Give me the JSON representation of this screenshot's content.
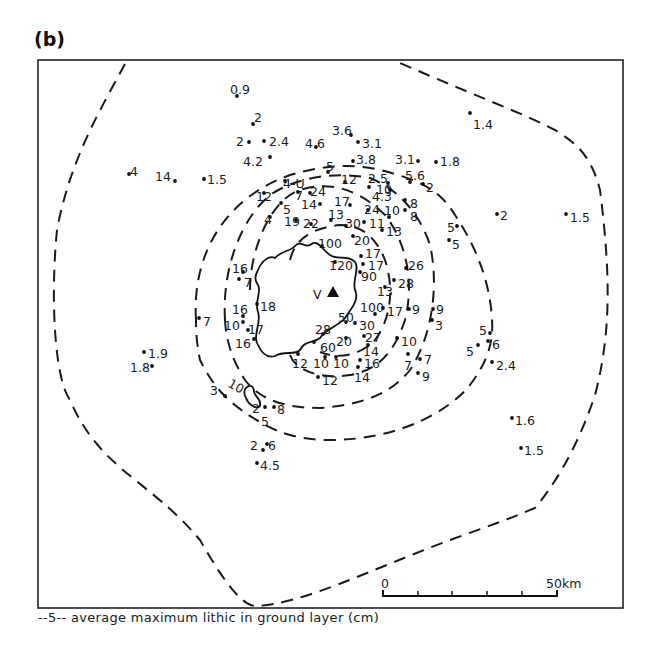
{
  "figure": {
    "panel_label": "(b)",
    "legend_text": "--5-- average maximum lithic in ground layer (cm)",
    "volcano_marker_label": "V",
    "scale_bar": {
      "start_label": "0",
      "end_label": "50km",
      "ticks": 6
    },
    "isopleth_labels": [
      "10",
      "5"
    ]
  },
  "chart_data": {
    "type": "map",
    "title": "(b)",
    "legend": "--5-- average maximum lithic in ground layer (cm)",
    "scale": "0-50 km",
    "isopleths_cm": [
      5,
      10
    ],
    "points": [
      {
        "v": "0.9",
        "x": 237,
        "y": 96,
        "lx": 230,
        "ly": 90
      },
      {
        "v": "2",
        "x": 253,
        "y": 124,
        "lx": 254,
        "ly": 118
      },
      {
        "v": "2",
        "x": 249,
        "y": 142,
        "lx": 236,
        "ly": 142
      },
      {
        "v": "2.4",
        "x": 264,
        "y": 141,
        "lx": 269,
        "ly": 142
      },
      {
        "v": "4.2",
        "x": 270,
        "y": 157,
        "lx": 243,
        "ly": 162
      },
      {
        "v": "4.6",
        "x": 316,
        "y": 147,
        "lx": 305,
        "ly": 144
      },
      {
        "v": "3.6",
        "x": 351,
        "y": 135,
        "lx": 332,
        "ly": 131
      },
      {
        "v": "3.1",
        "x": 358,
        "y": 142,
        "lx": 362,
        "ly": 144
      },
      {
        "v": "3.8",
        "x": 353,
        "y": 161,
        "lx": 356,
        "ly": 160
      },
      {
        "v": "3.1",
        "x": 418,
        "y": 161,
        "lx": 395,
        "ly": 160
      },
      {
        "v": "1.8",
        "x": 436,
        "y": 162,
        "lx": 440,
        "ly": 162
      },
      {
        "v": "1.4",
        "x": 470,
        "y": 113,
        "lx": 473,
        "ly": 125
      },
      {
        "v": "4",
        "x": 129,
        "y": 174,
        "lx": 130,
        "ly": 172
      },
      {
        "v": "14",
        "x": 175,
        "y": 181,
        "lx": 155,
        "ly": 177
      },
      {
        "v": "1.5",
        "x": 204,
        "y": 179,
        "lx": 207,
        "ly": 180
      },
      {
        "v": "5",
        "x": 328,
        "y": 172,
        "lx": 326,
        "ly": 167
      },
      {
        "v": "12",
        "x": 345,
        "y": 182,
        "lx": 341,
        "ly": 180
      },
      {
        "v": "2.5",
        "x": 388,
        "y": 183,
        "lx": 368,
        "ly": 179
      },
      {
        "v": "5.6",
        "x": 410,
        "y": 182,
        "lx": 405,
        "ly": 176
      },
      {
        "v": "2",
        "x": 423,
        "y": 184,
        "lx": 426,
        "ly": 188
      },
      {
        "v": "4.3",
        "x": 390,
        "y": 190,
        "lx": 372,
        "ly": 197
      },
      {
        "v": "10",
        "x": 369,
        "y": 187,
        "lx": 376,
        "ly": 190
      },
      {
        "v": "8",
        "x": 405,
        "y": 200,
        "lx": 410,
        "ly": 204
      },
      {
        "v": "8",
        "x": 405,
        "y": 210,
        "lx": 410,
        "ly": 217
      },
      {
        "v": "4-U",
        "x": 285,
        "y": 181,
        "lx": 283,
        "ly": 184
      },
      {
        "v": "12",
        "x": 264,
        "y": 193,
        "lx": 256,
        "ly": 197
      },
      {
        "v": "7",
        "x": 298,
        "y": 192,
        "lx": 295,
        "ly": 196
      },
      {
        "v": "24",
        "x": 310,
        "y": 193,
        "lx": 310,
        "ly": 192
      },
      {
        "v": "5",
        "x": 281,
        "y": 203,
        "lx": 283,
        "ly": 210
      },
      {
        "v": "14",
        "x": 320,
        "y": 204,
        "lx": 301,
        "ly": 205
      },
      {
        "v": "17",
        "x": 350,
        "y": 205,
        "lx": 334,
        "ly": 202
      },
      {
        "v": "24",
        "x": 368,
        "y": 210,
        "lx": 364,
        "ly": 210
      },
      {
        "v": "10",
        "x": 389,
        "y": 217,
        "lx": 384,
        "ly": 211
      },
      {
        "v": "4",
        "x": 270,
        "y": 217,
        "lx": 264,
        "ly": 220
      },
      {
        "v": "19",
        "x": 296,
        "y": 220,
        "lx": 284,
        "ly": 222
      },
      {
        "v": "22",
        "x": 311,
        "y": 224,
        "lx": 303,
        "ly": 224
      },
      {
        "v": "13",
        "x": 331,
        "y": 220,
        "lx": 328,
        "ly": 215
      },
      {
        "v": "30",
        "x": 346,
        "y": 226,
        "lx": 345,
        "ly": 224
      },
      {
        "v": "11",
        "x": 364,
        "y": 222,
        "lx": 369,
        "ly": 224
      },
      {
        "v": "13",
        "x": 382,
        "y": 230,
        "lx": 386,
        "ly": 232
      },
      {
        "v": "20",
        "x": 353,
        "y": 236,
        "lx": 354,
        "ly": 241
      },
      {
        "v": "100",
        "x": 322,
        "y": 246,
        "lx": 318,
        "ly": 244
      },
      {
        "v": "17",
        "x": 361,
        "y": 256,
        "lx": 365,
        "ly": 254
      },
      {
        "v": "120",
        "x": 335,
        "y": 262,
        "lx": 329,
        "ly": 266
      },
      {
        "v": "17",
        "x": 363,
        "y": 264,
        "lx": 368,
        "ly": 266
      },
      {
        "v": "90",
        "x": 360,
        "y": 272,
        "lx": 361,
        "ly": 277
      },
      {
        "v": "26",
        "x": 406,
        "y": 268,
        "lx": 408,
        "ly": 266
      },
      {
        "v": "28",
        "x": 394,
        "y": 280,
        "lx": 398,
        "ly": 284
      },
      {
        "v": "13",
        "x": 385,
        "y": 287,
        "lx": 377,
        "ly": 292
      },
      {
        "v": "16",
        "x": 243,
        "y": 272,
        "lx": 232,
        "ly": 269
      },
      {
        "v": "7",
        "x": 239,
        "y": 279,
        "lx": 244,
        "ly": 283
      },
      {
        "v": "18",
        "x": 257,
        "y": 304,
        "lx": 260,
        "ly": 307
      },
      {
        "v": "16",
        "x": 243,
        "y": 316,
        "lx": 232,
        "ly": 310
      },
      {
        "v": "10",
        "x": 243,
        "y": 322,
        "lx": 224,
        "ly": 326
      },
      {
        "v": "17",
        "x": 248,
        "y": 330,
        "lx": 248,
        "ly": 330
      },
      {
        "v": "16",
        "x": 254,
        "y": 339,
        "lx": 235,
        "ly": 344
      },
      {
        "v": "7",
        "x": 199,
        "y": 318,
        "lx": 203,
        "ly": 322
      },
      {
        "v": "100",
        "x": 375,
        "y": 314,
        "lx": 360,
        "ly": 308
      },
      {
        "v": "17",
        "x": 383,
        "y": 308,
        "lx": 387,
        "ly": 312
      },
      {
        "v": "9",
        "x": 409,
        "y": 309,
        "lx": 412,
        "ly": 310
      },
      {
        "v": "9",
        "x": 433,
        "y": 309,
        "lx": 436,
        "ly": 310
      },
      {
        "v": "3",
        "x": 432,
        "y": 320,
        "lx": 435,
        "ly": 326
      },
      {
        "v": "50",
        "x": 346,
        "y": 322,
        "lx": 338,
        "ly": 318
      },
      {
        "v": "30",
        "x": 355,
        "y": 323,
        "lx": 359,
        "ly": 326
      },
      {
        "v": "28",
        "x": 323,
        "y": 334,
        "lx": 315,
        "ly": 330
      },
      {
        "v": "20",
        "x": 346,
        "y": 338,
        "lx": 336,
        "ly": 342
      },
      {
        "v": "27",
        "x": 364,
        "y": 336,
        "lx": 365,
        "ly": 338
      },
      {
        "v": "10",
        "x": 397,
        "y": 338,
        "lx": 401,
        "ly": 342
      },
      {
        "v": "60",
        "x": 314,
        "y": 342,
        "lx": 320,
        "ly": 348
      },
      {
        "v": "14",
        "x": 368,
        "y": 345,
        "lx": 363,
        "ly": 352
      },
      {
        "v": "12",
        "x": 298,
        "y": 354,
        "lx": 292,
        "ly": 364
      },
      {
        "v": "10",
        "x": 325,
        "y": 357,
        "lx": 313,
        "ly": 364
      },
      {
        "v": "10",
        "x": 336,
        "y": 357,
        "lx": 333,
        "ly": 364
      },
      {
        "v": "16",
        "x": 360,
        "y": 360,
        "lx": 364,
        "ly": 364
      },
      {
        "v": "14",
        "x": 358,
        "y": 367,
        "lx": 354,
        "ly": 378
      },
      {
        "v": "12",
        "x": 318,
        "y": 377,
        "lx": 322,
        "ly": 381
      },
      {
        "v": "7",
        "x": 408,
        "y": 354,
        "lx": 404,
        "ly": 366
      },
      {
        "v": "7",
        "x": 420,
        "y": 359,
        "lx": 424,
        "ly": 360
      },
      {
        "v": "9",
        "x": 418,
        "y": 373,
        "lx": 422,
        "ly": 377
      },
      {
        "v": "5",
        "x": 490,
        "y": 333,
        "lx": 479,
        "ly": 331
      },
      {
        "v": "6",
        "x": 488,
        "y": 341,
        "lx": 492,
        "ly": 345
      },
      {
        "v": "5",
        "x": 478,
        "y": 345,
        "lx": 466,
        "ly": 352
      },
      {
        "v": "2.4",
        "x": 492,
        "y": 362,
        "lx": 496,
        "ly": 366
      },
      {
        "v": "1.9",
        "x": 144,
        "y": 352,
        "lx": 148,
        "ly": 354
      },
      {
        "v": "1.8",
        "x": 152,
        "y": 366,
        "lx": 130,
        "ly": 368
      },
      {
        "v": "3",
        "x": 225,
        "y": 396,
        "lx": 210,
        "ly": 391
      },
      {
        "v": "2",
        "x": 265,
        "y": 407,
        "lx": 252,
        "ly": 409
      },
      {
        "v": "8",
        "x": 274,
        "y": 407,
        "lx": 277,
        "ly": 410
      },
      {
        "v": "2",
        "x": 263,
        "y": 450,
        "lx": 250,
        "ly": 446
      },
      {
        "v": "6",
        "x": 267,
        "y": 444,
        "lx": 268,
        "ly": 446
      },
      {
        "v": "4.5",
        "x": 257,
        "y": 463,
        "lx": 260,
        "ly": 466
      },
      {
        "v": "2",
        "x": 497,
        "y": 214,
        "lx": 500,
        "ly": 216
      },
      {
        "v": "1.5",
        "x": 566,
        "y": 214,
        "lx": 570,
        "ly": 218
      },
      {
        "v": "5",
        "x": 457,
        "y": 226,
        "lx": 447,
        "ly": 228
      },
      {
        "v": "5",
        "x": 449,
        "y": 240,
        "lx": 452,
        "ly": 245
      },
      {
        "v": "1.6",
        "x": 512,
        "y": 418,
        "lx": 515,
        "ly": 421
      },
      {
        "v": "1.5",
        "x": 521,
        "y": 448,
        "lx": 524,
        "ly": 451
      }
    ]
  }
}
